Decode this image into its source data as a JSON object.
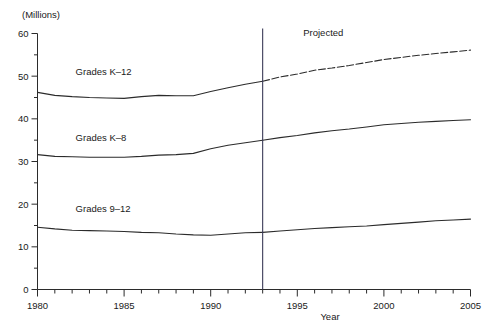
{
  "chart_data": {
    "type": "line",
    "title": "",
    "unit_label": "(Millions)",
    "xlabel": "Year",
    "ylabel": "",
    "xlim": [
      1980,
      2005
    ],
    "ylim": [
      0,
      60
    ],
    "y_ticks": [
      0,
      10,
      20,
      30,
      40,
      50,
      60
    ],
    "y_minor_ticks": [
      5,
      15,
      25,
      35,
      45,
      55
    ],
    "x_ticks": [
      1980,
      1985,
      1990,
      1995,
      2000,
      2005
    ],
    "x_minor_ticks": [
      1981,
      1982,
      1983,
      1984,
      1986,
      1987,
      1988,
      1989,
      1991,
      1992,
      1993,
      1994,
      1996,
      1997,
      1998,
      1999,
      2001,
      2002,
      2003,
      2004
    ],
    "grid": false,
    "legend_position": "inline-labels",
    "projection_start_year": 1993,
    "annotations": [
      {
        "text": "Projected",
        "x": 1996.5,
        "y": 59.5
      }
    ],
    "x": [
      1980,
      1981,
      1982,
      1983,
      1984,
      1985,
      1986,
      1987,
      1988,
      1989,
      1990,
      1991,
      1992,
      1993,
      1994,
      1995,
      1996,
      1997,
      1998,
      1999,
      2000,
      2001,
      2002,
      2003,
      2004,
      2005
    ],
    "series": [
      {
        "name": "Grades K-12",
        "label": "Grades K–12",
        "label_x": 1982.2,
        "label_y": 50.2,
        "values": [
          46.2,
          45.5,
          45.2,
          45.0,
          44.9,
          44.8,
          45.2,
          45.5,
          45.4,
          45.4,
          46.4,
          47.3,
          48.1,
          48.8,
          49.8,
          50.5,
          51.4,
          51.9,
          52.5,
          53.2,
          53.9,
          54.4,
          54.9,
          55.3,
          55.7,
          56.1
        ]
      },
      {
        "name": "Grades K-8",
        "label": "Grades K–8",
        "label_x": 1982.2,
        "label_y": 34.8,
        "values": [
          31.6,
          31.2,
          31.1,
          31.0,
          31.0,
          31.0,
          31.2,
          31.5,
          31.6,
          31.9,
          33.0,
          33.8,
          34.4,
          35.0,
          35.6,
          36.1,
          36.7,
          37.2,
          37.6,
          38.1,
          38.6,
          38.9,
          39.2,
          39.4,
          39.6,
          39.8
        ]
      },
      {
        "name": "Grades 9-12",
        "label": "Grades 9–12",
        "label_x": 1982.2,
        "label_y": 18.2,
        "values": [
          14.6,
          14.2,
          13.9,
          13.8,
          13.7,
          13.6,
          13.4,
          13.3,
          13.0,
          12.8,
          12.7,
          13.0,
          13.3,
          13.4,
          13.7,
          14.0,
          14.3,
          14.5,
          14.7,
          14.9,
          15.2,
          15.5,
          15.8,
          16.1,
          16.3,
          16.5
        ]
      }
    ]
  }
}
